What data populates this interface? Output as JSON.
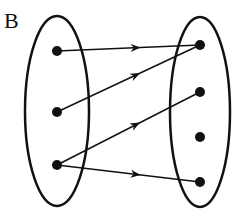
{
  "diagram": {
    "label": "B",
    "stroke_color": "#111111",
    "domain_set": {
      "ellipse": {
        "cx": 57,
        "cy": 111,
        "rx": 32,
        "ry": 95
      },
      "points": [
        {
          "id": "L1",
          "x": 57,
          "y": 51
        },
        {
          "id": "L2",
          "x": 57,
          "y": 112
        },
        {
          "id": "L3",
          "x": 57,
          "y": 165
        }
      ]
    },
    "codomain_set": {
      "ellipse": {
        "cx": 200,
        "cy": 112,
        "rx": 30,
        "ry": 95
      },
      "points": [
        {
          "id": "R1",
          "x": 200,
          "y": 45
        },
        {
          "id": "R2",
          "x": 200,
          "y": 92
        },
        {
          "id": "R3",
          "x": 200,
          "y": 137
        },
        {
          "id": "R4",
          "x": 200,
          "y": 182
        }
      ]
    },
    "arrows": [
      {
        "from": "L1",
        "to": "R1"
      },
      {
        "from": "L2",
        "to": "R1"
      },
      {
        "from": "L3",
        "to": "R2"
      },
      {
        "from": "L3",
        "to": "R4"
      }
    ]
  }
}
